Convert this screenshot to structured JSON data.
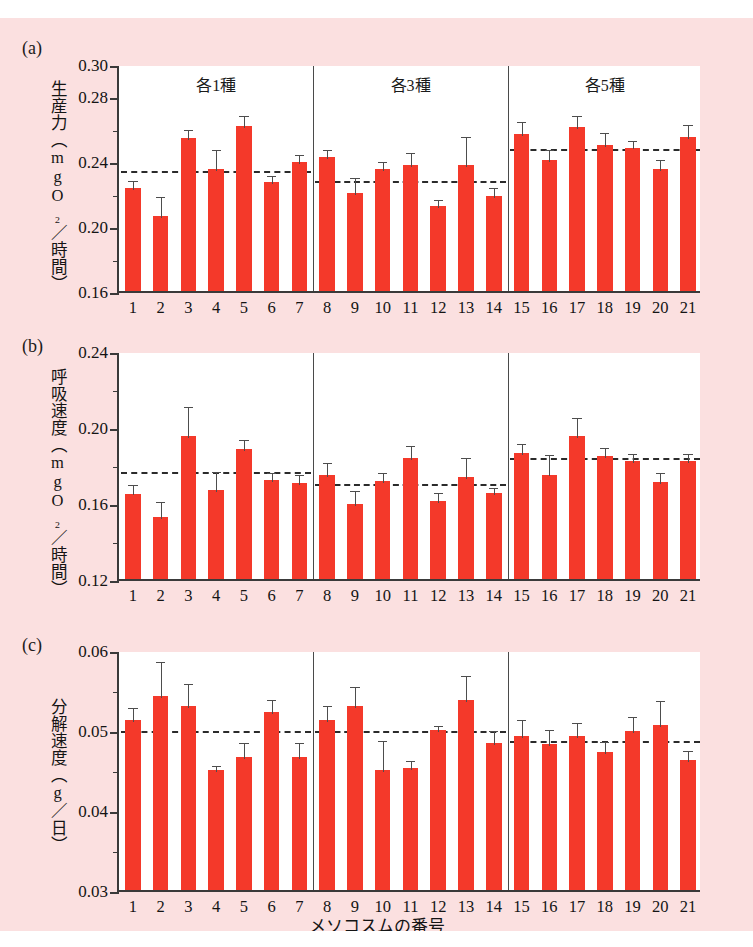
{
  "figure": {
    "background_color": "#fbe0e0",
    "bar_color": "#f4392a",
    "xaxis_title": "メソコスムの番号",
    "group_labels": [
      "各1種",
      "各3種",
      "各5種"
    ],
    "panel_letters": [
      "(a)",
      "(b)",
      "(c)"
    ]
  },
  "chart_data": [
    {
      "type": "bar",
      "panel": "(a)",
      "title": "",
      "ylabel": "生産力（mgO₂／時間）",
      "xlabel": "メソコスムの番号",
      "categories": [
        "1",
        "2",
        "3",
        "4",
        "5",
        "6",
        "7",
        "8",
        "9",
        "10",
        "11",
        "12",
        "13",
        "14",
        "15",
        "16",
        "17",
        "18",
        "19",
        "20",
        "21"
      ],
      "values": [
        0.2235,
        0.206,
        0.2545,
        0.2355,
        0.2615,
        0.227,
        0.2395,
        0.2425,
        0.2205,
        0.2355,
        0.238,
        0.2125,
        0.238,
        0.2185,
        0.257,
        0.241,
        0.261,
        0.25,
        0.2485,
        0.2355,
        0.255
      ],
      "errors": [
        0.0055,
        0.0135,
        0.006,
        0.013,
        0.0075,
        0.005,
        0.0055,
        0.006,
        0.0105,
        0.0055,
        0.0085,
        0.005,
        0.0185,
        0.006,
        0.0085,
        0.0075,
        0.008,
        0.0085,
        0.005,
        0.0065,
        0.0085
      ],
      "ylim": [
        0.16,
        0.3
      ],
      "yticks": [
        0.16,
        0.2,
        0.24,
        0.28,
        0.3
      ],
      "yticklabels": [
        "0.16",
        "0.20",
        "0.24",
        "0.28",
        "0.30"
      ],
      "group_means": [
        0.2355,
        0.229,
        0.249
      ],
      "groups": [
        {
          "label": "各1種",
          "from": 1,
          "to": 7
        },
        {
          "label": "各3種",
          "from": 8,
          "to": 14
        },
        {
          "label": "各5種",
          "from": 15,
          "to": 21
        }
      ],
      "grid": false,
      "legend": "none",
      "annotations": [
        "mean dashed line per group"
      ]
    },
    {
      "type": "bar",
      "panel": "(b)",
      "title": "",
      "ylabel": "呼吸速度（mgO₂／時間）",
      "xlabel": "メソコスムの番号",
      "categories": [
        "1",
        "2",
        "3",
        "4",
        "5",
        "6",
        "7",
        "8",
        "9",
        "10",
        "11",
        "12",
        "13",
        "14",
        "15",
        "16",
        "17",
        "18",
        "19",
        "20",
        "21"
      ],
      "values": [
        0.165,
        0.1525,
        0.1955,
        0.167,
        0.1885,
        0.172,
        0.1705,
        0.1745,
        0.1595,
        0.1715,
        0.1835,
        0.161,
        0.1735,
        0.1655,
        0.1865,
        0.175,
        0.1955,
        0.185,
        0.182,
        0.171,
        0.182
      ],
      "errors": [
        0.0055,
        0.009,
        0.016,
        0.0105,
        0.0055,
        0.005,
        0.0055,
        0.0075,
        0.008,
        0.0055,
        0.0075,
        0.0055,
        0.011,
        0.0035,
        0.0055,
        0.0115,
        0.0105,
        0.005,
        0.005,
        0.006,
        0.005
      ],
      "ylim": [
        0.12,
        0.24
      ],
      "yticks": [
        0.12,
        0.16,
        0.2,
        0.24
      ],
      "yticklabels": [
        "0.12",
        "0.16",
        "0.20",
        "0.24"
      ],
      "group_means": [
        0.1775,
        0.171,
        0.1845
      ],
      "groups": [
        {
          "label": "各1種",
          "from": 1,
          "to": 7
        },
        {
          "label": "各3種",
          "from": 8,
          "to": 14
        },
        {
          "label": "各5種",
          "from": 15,
          "to": 21
        }
      ],
      "grid": false,
      "legend": "none",
      "annotations": [
        "mean dashed line per group"
      ]
    },
    {
      "type": "bar",
      "panel": "(c)",
      "title": "",
      "ylabel": "分解速度（g／日）",
      "xlabel": "メソコスムの番号",
      "categories": [
        "1",
        "2",
        "3",
        "4",
        "5",
        "6",
        "7",
        "8",
        "9",
        "10",
        "11",
        "12",
        "13",
        "14",
        "15",
        "16",
        "17",
        "18",
        "19",
        "20",
        "21"
      ],
      "values": [
        0.0512,
        0.0543,
        0.053,
        0.045,
        0.0466,
        0.0522,
        0.0466,
        0.0512,
        0.053,
        0.045,
        0.0452,
        0.05,
        0.0537,
        0.0484,
        0.0493,
        0.0482,
        0.0493,
        0.0473,
        0.0499,
        0.0506,
        0.0463
      ],
      "errors": [
        0.0018,
        0.0045,
        0.003,
        0.0008,
        0.002,
        0.0018,
        0.002,
        0.0021,
        0.0026,
        0.0039,
        0.0012,
        0.0008,
        0.0033,
        0.0017,
        0.0022,
        0.0021,
        0.0018,
        0.0014,
        0.002,
        0.0033,
        0.0013
      ],
      "ylim": [
        0.03,
        0.06
      ],
      "yticks": [
        0.03,
        0.04,
        0.05,
        0.06
      ],
      "yticklabels": [
        "0.03",
        "0.04",
        "0.05",
        "0.06"
      ],
      "group_means": [
        0.0501,
        0.0501,
        0.0489
      ],
      "groups": [
        {
          "label": "各1種",
          "from": 1,
          "to": 7
        },
        {
          "label": "各3種",
          "from": 8,
          "to": 14
        },
        {
          "label": "各5種",
          "from": 15,
          "to": 21
        }
      ],
      "grid": false,
      "legend": "none",
      "annotations": [
        "mean dashed line per group"
      ]
    }
  ]
}
